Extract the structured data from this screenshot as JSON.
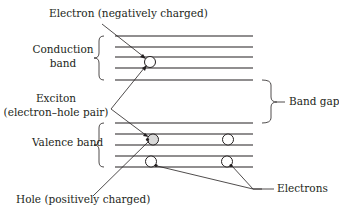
{
  "diagram": {
    "labels": {
      "electron_neg": "Electron (negatively charged)",
      "conduction_1": "Conduction",
      "conduction_2": "band",
      "exciton_1": "Exciton",
      "exciton_2": "(electron–hole pair)",
      "valence": "Valence band",
      "band_gap": "Band gap",
      "hole_pos": "Hole (positively charged)",
      "electrons": "Electrons"
    },
    "conduction_band_levels": 5,
    "valence_band_levels": 5,
    "colors": {
      "ink": "#231f20",
      "electron_fill": "#d9d9d9",
      "hole_fill": "#ffffff"
    }
  }
}
